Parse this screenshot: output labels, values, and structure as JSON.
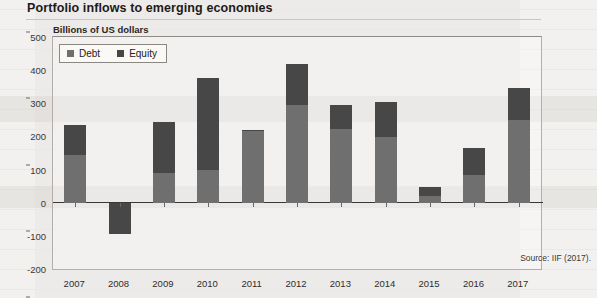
{
  "title": "Portfolio inflows to emerging economies",
  "source": "Source: IIF (2017).",
  "legend": {
    "debt": "Debt",
    "equity": "Equity"
  },
  "chart_data": {
    "type": "bar",
    "stacked": true,
    "title": "Portfolio inflows to emerging economies",
    "subtitle": "Billions of US dollars",
    "xlabel": "",
    "ylabel": "Billions of US dollars",
    "ylim": [
      -200,
      500
    ],
    "ytick_step": 100,
    "yticks": [
      500,
      400,
      300,
      200,
      100,
      0,
      -100,
      -200
    ],
    "grid": false,
    "legend_position": "top-left",
    "categories": [
      "2007",
      "2008",
      "2009",
      "2010",
      "2011",
      "2012",
      "2013",
      "2014",
      "2015",
      "2016",
      "2017"
    ],
    "series": [
      {
        "name": "Debt",
        "color": "#6f6f6f",
        "values": [
          145,
          0,
          90,
          100,
          215,
          295,
          222,
          198,
          20,
          85,
          250
        ]
      },
      {
        "name": "Equity",
        "color": "#474747",
        "values": [
          90,
          -95,
          155,
          275,
          5,
          123,
          73,
          105,
          28,
          80,
          95
        ]
      }
    ],
    "totals": [
      235,
      -95,
      245,
      375,
      220,
      418,
      295,
      303,
      48,
      165,
      345
    ]
  }
}
